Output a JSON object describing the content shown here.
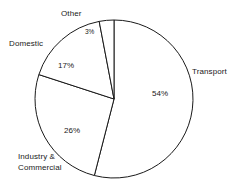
{
  "chart_data": {
    "type": "pie",
    "title": "",
    "subtitle": "",
    "xlabel": "",
    "ylabel": "",
    "legend_position": "none",
    "grid": false,
    "value_unit": "%",
    "categories": [
      "Transport",
      "Industry & Commercial",
      "Domestic",
      "Other"
    ],
    "values": [
      54,
      26,
      17,
      3
    ],
    "slices": [
      {
        "label": "Transport",
        "value": 54,
        "value_label": "54%",
        "start_angle_deg": 0,
        "end_angle_deg": 194.4,
        "fill": "#ffffff",
        "stroke": "#1a1a1a"
      },
      {
        "label": "Industry & Commercial",
        "value": 26,
        "value_label": "26%",
        "start_angle_deg": 194.4,
        "end_angle_deg": 288.0,
        "fill": "#ffffff",
        "stroke": "#1a1a1a"
      },
      {
        "label": "Domestic",
        "value": 17,
        "value_label": "17%",
        "start_angle_deg": 288.0,
        "end_angle_deg": 349.2,
        "fill": "#ffffff",
        "stroke": "#1a1a1a"
      },
      {
        "label": "Other",
        "value": 3,
        "value_label": "3%",
        "start_angle_deg": 349.2,
        "end_angle_deg": 360.0,
        "fill": "#ffffff",
        "stroke": "#1a1a1a"
      }
    ]
  },
  "labels": {
    "other": "Other",
    "domestic": "Domestic",
    "transport": "Transport",
    "industry_line1": "Industry &",
    "industry_line2": "Commercial"
  },
  "percents": {
    "other": "3%",
    "domestic": "17%",
    "transport": "54%",
    "industry": "26%"
  },
  "colors": {
    "background": "#ffffff",
    "outline": "#1a1a1a",
    "slice_fill": "#ffffff",
    "text": "#1a1a1a"
  }
}
